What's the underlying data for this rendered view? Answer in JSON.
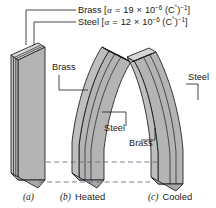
{
  "figure": {
    "background_color": "#ffffff",
    "ink_color": "#1a1a1a",
    "face_color": "#b4b4b4",
    "top_color": "#d2d2d2",
    "edge_color": "#9a9a9a"
  },
  "callouts": {
    "brass": {
      "material": "Brass",
      "bracket_open": "[",
      "symbol": "α",
      "equals": "=",
      "value": "19",
      "times": "×",
      "base": "10",
      "exponent": "−6",
      "unit_open": "(C",
      "degree": "°",
      "unit_close": ")",
      "unit_exponent": "−1",
      "bracket_close": "]"
    },
    "steel": {
      "material": "Steel",
      "bracket_open": "[",
      "symbol": "α",
      "equals": "=",
      "value": "12",
      "times": "×",
      "base": "10",
      "exponent": "−6",
      "unit_open": "(C",
      "degree": "°",
      "unit_close": ")",
      "unit_exponent": "−1",
      "bracket_close": "]"
    }
  },
  "part_labels": {
    "b_brass": "Brass",
    "b_steel": "Steel",
    "c_steel": "Steel",
    "c_brass": "Brass"
  },
  "captions": {
    "a": {
      "letter": "(a)",
      "text": ""
    },
    "b": {
      "letter": "(b)",
      "text": "Heated"
    },
    "c": {
      "letter": "(c)",
      "text": "Cooled"
    }
  }
}
